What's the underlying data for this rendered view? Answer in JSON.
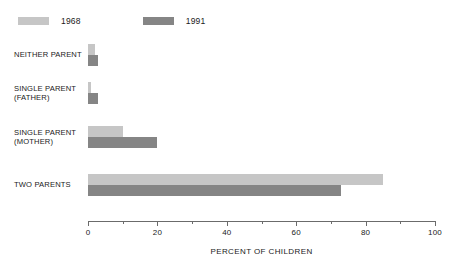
{
  "chart_data": {
    "type": "bar",
    "orientation": "horizontal",
    "title": "",
    "xlabel": "PERCENT OF CHILDREN",
    "ylabel": "",
    "xlim": [
      0,
      100
    ],
    "xticks": [
      0,
      20,
      40,
      60,
      80,
      100
    ],
    "xtick_labels": [
      "0",
      "20",
      "40",
      "60",
      "80",
      "100"
    ],
    "minor_xticks": [
      10,
      30,
      50,
      70,
      90
    ],
    "grid": false,
    "legend_position": "top-left",
    "categories": [
      "NEITHER PARENT",
      "SINGLE PARENT\n(FATHER)",
      "SINGLE PARENT\n(MOTHER)",
      "TWO PARENTS"
    ],
    "series": [
      {
        "name": "1968",
        "color": "#c6c6c6",
        "values": [
          2,
          1,
          10,
          85
        ]
      },
      {
        "name": "1991",
        "color": "#858585",
        "values": [
          3,
          3,
          20,
          73
        ]
      }
    ]
  },
  "legend": {
    "entries": [
      {
        "label": "1968",
        "color": "#c6c6c6"
      },
      {
        "label": "1991",
        "color": "#858585"
      }
    ]
  },
  "axis": {
    "title": "PERCENT OF CHILDREN",
    "tick_labels": [
      "0",
      "20",
      "40",
      "60",
      "80",
      "100"
    ]
  },
  "colors": {
    "series_1968": "#c6c6c6",
    "series_1991": "#858585",
    "axis": "#6b6b6b",
    "text": "#1a1a1a",
    "background": "#ffffff"
  }
}
